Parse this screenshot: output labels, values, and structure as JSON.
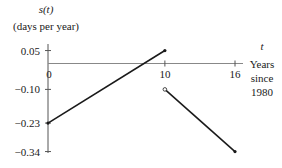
{
  "chart_data": {
    "type": "line",
    "title": "",
    "ylabel_line1": "s(t)",
    "ylabel_line2": "(days per year)",
    "xlabel_var": "t",
    "xlabel_lines": [
      "Years",
      "since",
      "1980"
    ],
    "xlim": [
      0,
      16
    ],
    "ylim": [
      -0.34,
      0.05
    ],
    "x_ticks": [
      0,
      10,
      16
    ],
    "x_tick_labels": [
      "0",
      "10",
      "16"
    ],
    "y_ticks": [
      0.05,
      -0.1,
      -0.23,
      -0.34
    ],
    "y_tick_labels": [
      "0.05",
      "−0.10",
      "−0.23",
      "−0.34"
    ],
    "grid": false,
    "series": [
      {
        "name": "segment-1",
        "points": [
          [
            0,
            -0.23
          ],
          [
            10,
            0.05
          ]
        ],
        "start_marker": "closed",
        "end_marker": "closed"
      },
      {
        "name": "segment-2",
        "points": [
          [
            10,
            -0.1
          ],
          [
            16,
            -0.34
          ]
        ],
        "start_marker": "open",
        "end_marker": "closed"
      }
    ],
    "colors": {
      "line": "#1a1a1a",
      "axis": "#555555"
    }
  }
}
